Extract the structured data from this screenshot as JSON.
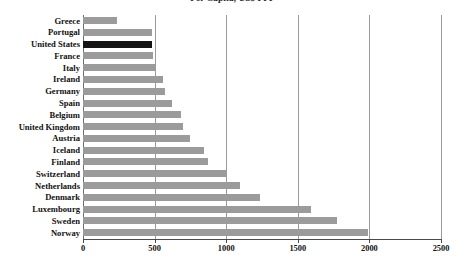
{
  "chart_data": {
    "type": "bar",
    "orientation": "horizontal",
    "title": "Per Capita, US$ PPP",
    "title_lines": [
      "Per Capita, US$ PPP"
    ],
    "xlabel": "",
    "ylabel": "",
    "xlim": [
      0,
      2500
    ],
    "xticks": [
      "0",
      "500",
      "1000",
      "1500",
      "2000",
      "2500"
    ],
    "xtick_values": [
      0,
      500,
      1000,
      1500,
      2000,
      2500
    ],
    "grid": "vertical",
    "legend": "none",
    "highlight_category": "United States",
    "categories": [
      "Greece",
      "Portugal",
      "United States",
      "France",
      "Italy",
      "Ireland",
      "Germany",
      "Spain",
      "Belgium",
      "United Kingdom",
      "Austria",
      "Iceland",
      "Finland",
      "Switzerland",
      "Netherlands",
      "Denmark",
      "Luxembourg",
      "Sweden",
      "Norway"
    ],
    "values": [
      237,
      482,
      482,
      489,
      510,
      559,
      573,
      622,
      685,
      699,
      748,
      845,
      874,
      1008,
      1098,
      1237,
      1593,
      1773,
      1990
    ]
  },
  "colors": {
    "bar": "#9b9b9b",
    "bar_highlight": "#141414",
    "gridline": "#9a9a9a",
    "axis": "#4a4a4a",
    "text": "#111111",
    "background": "#ffffff"
  }
}
